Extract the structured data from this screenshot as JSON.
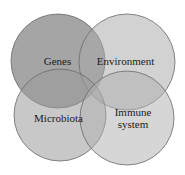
{
  "diagram": {
    "type": "venn",
    "sets": [
      {
        "id": "genes",
        "label": "Genes",
        "cx": 58,
        "cy": 61,
        "r": 47,
        "fill": "#6e6e6e",
        "opacity": 0.62
      },
      {
        "id": "environment",
        "label": "Environment",
        "cx": 127,
        "cy": 62,
        "r": 48,
        "fill": "#a8a8a8",
        "opacity": 0.52
      },
      {
        "id": "microbiota",
        "label": "Microbiota",
        "cx": 60,
        "cy": 115,
        "r": 46,
        "fill": "#9a9a9a",
        "opacity": 0.55
      },
      {
        "id": "immune-system",
        "label_lines": [
          "Immune",
          "system"
        ],
        "cx": 127,
        "cy": 118,
        "r": 47,
        "fill": "#b0b0b0",
        "opacity": 0.52
      }
    ],
    "stroke": "#6a6a6a",
    "labels": {
      "genes": "Genes",
      "environment": "Environment",
      "microbiota": "Microbiota",
      "immune_line1": "Immune",
      "immune_line2": "system"
    }
  }
}
